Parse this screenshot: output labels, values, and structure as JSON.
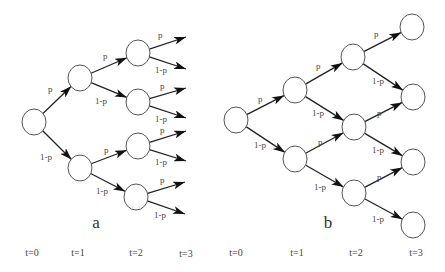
{
  "figure": {
    "width": 445,
    "height": 272,
    "node_radius": 12,
    "colors": {
      "node_stroke": "#555555",
      "edge": "#222222",
      "arrowhead": "#111111",
      "text": "#444444"
    }
  },
  "trees": [
    {
      "id": "a",
      "caption": "a",
      "caption_pos": [
        96,
        228
      ],
      "type": "binary-tree (non-recombining)",
      "nodes": [
        {
          "id": "a0",
          "t": 0,
          "x": 34,
          "y": 122
        },
        {
          "id": "a1u",
          "t": 1,
          "x": 80,
          "y": 78
        },
        {
          "id": "a1d",
          "t": 1,
          "x": 80,
          "y": 168
        },
        {
          "id": "a2uu",
          "t": 2,
          "x": 138,
          "y": 53
        },
        {
          "id": "a2ud",
          "t": 2,
          "x": 138,
          "y": 102
        },
        {
          "id": "a2du",
          "t": 2,
          "x": 138,
          "y": 146
        },
        {
          "id": "a2dd",
          "t": 2,
          "x": 136,
          "y": 197
        }
      ],
      "edges": [
        {
          "from": "a0",
          "to": "a1u",
          "label": "p",
          "label_pos": [
            48,
            92
          ]
        },
        {
          "from": "a0",
          "to": "a1d",
          "label": "1-p",
          "label_pos": [
            40,
            160
          ]
        },
        {
          "from": "a1u",
          "to": "a2uu",
          "label": "p",
          "label_pos": [
            103,
            59
          ]
        },
        {
          "from": "a1u",
          "to": "a2ud",
          "label": "1-p",
          "label_pos": [
            95,
            104
          ]
        },
        {
          "from": "a1d",
          "to": "a2du",
          "label": "p",
          "label_pos": [
            104,
            153
          ]
        },
        {
          "from": "a1d",
          "to": "a2dd",
          "label": "1-p",
          "label_pos": [
            96,
            194
          ]
        }
      ],
      "open_edges": [
        {
          "from": "a2uu",
          "to": [
            186,
            37
          ],
          "label": "p",
          "label_pos": [
            158,
            38
          ]
        },
        {
          "from": "a2uu",
          "to": [
            186,
            69
          ],
          "label": "1-p",
          "label_pos": [
            155,
            73
          ]
        },
        {
          "from": "a2ud",
          "to": [
            186,
            88
          ],
          "label": "p",
          "label_pos": [
            160,
            89
          ]
        },
        {
          "from": "a2ud",
          "to": [
            186,
            118
          ],
          "label": "1-p",
          "label_pos": [
            155,
            122
          ]
        },
        {
          "from": "a2du",
          "to": [
            186,
            131
          ],
          "label": "p",
          "label_pos": [
            160,
            133
          ]
        },
        {
          "from": "a2du",
          "to": [
            186,
            161
          ],
          "label": "1-p",
          "label_pos": [
            155,
            165
          ]
        },
        {
          "from": "a2dd",
          "to": [
            185,
            182
          ],
          "label": "p",
          "label_pos": [
            160,
            183
          ]
        },
        {
          "from": "a2dd",
          "to": [
            185,
            214
          ],
          "label": "1-p",
          "label_pos": [
            154,
            218
          ]
        }
      ],
      "time_labels": [
        {
          "label": "t=0",
          "x": 32,
          "y": 256
        },
        {
          "label": "t=1",
          "x": 78,
          "y": 256
        },
        {
          "label": "t=2",
          "x": 136,
          "y": 256
        },
        {
          "label": "t=3",
          "x": 186,
          "y": 257
        }
      ]
    },
    {
      "id": "b",
      "caption": "b",
      "caption_pos": [
        328,
        228
      ],
      "type": "recombining lattice",
      "nodes": [
        {
          "id": "b0",
          "t": 0,
          "x": 236,
          "y": 120
        },
        {
          "id": "b1u",
          "t": 1,
          "x": 295,
          "y": 90
        },
        {
          "id": "b1d",
          "t": 1,
          "x": 295,
          "y": 159
        },
        {
          "id": "b2u",
          "t": 2,
          "x": 353,
          "y": 57
        },
        {
          "id": "b2m",
          "t": 2,
          "x": 354,
          "y": 127
        },
        {
          "id": "b2d",
          "t": 2,
          "x": 354,
          "y": 193
        },
        {
          "id": "b3a",
          "t": 3,
          "x": 412,
          "y": 27
        },
        {
          "id": "b3b",
          "t": 3,
          "x": 413,
          "y": 97
        },
        {
          "id": "b3c",
          "t": 3,
          "x": 413,
          "y": 162
        },
        {
          "id": "b3d",
          "t": 3,
          "x": 413,
          "y": 225
        }
      ],
      "edges": [
        {
          "from": "b0",
          "to": "b1u",
          "label": "p",
          "label_pos": [
            258,
            102
          ]
        },
        {
          "from": "b0",
          "to": "b1d",
          "label": "1-p",
          "label_pos": [
            254,
            148
          ]
        },
        {
          "from": "b1u",
          "to": "b2u",
          "label": "p",
          "label_pos": [
            316,
            69
          ]
        },
        {
          "from": "b1u",
          "to": "b2m",
          "label": "1-p",
          "label_pos": [
            312,
            116
          ]
        },
        {
          "from": "b1d",
          "to": "b2m",
          "label": "p",
          "label_pos": [
            318,
            145
          ]
        },
        {
          "from": "b1d",
          "to": "b2d",
          "label": "1-p",
          "label_pos": [
            314,
            190
          ]
        },
        {
          "from": "b2u",
          "to": "b3a",
          "label": "p",
          "label_pos": [
            374,
            37
          ]
        },
        {
          "from": "b2u",
          "to": "b3b",
          "label": "1-p",
          "label_pos": [
            372,
            84
          ]
        },
        {
          "from": "b2m",
          "to": "b3b",
          "label": "p",
          "label_pos": [
            377,
            116
          ]
        },
        {
          "from": "b2m",
          "to": "b3c",
          "label": "1-p",
          "label_pos": [
            372,
            153
          ]
        },
        {
          "from": "b2d",
          "to": "b3c",
          "label": "p",
          "label_pos": [
            377,
            180
          ]
        },
        {
          "from": "b2d",
          "to": "b3d",
          "label": "1-p",
          "label_pos": [
            372,
            222
          ]
        }
      ],
      "open_edges": [],
      "time_labels": [
        {
          "label": "t=0",
          "x": 236,
          "y": 256
        },
        {
          "label": "t=1",
          "x": 297,
          "y": 256
        },
        {
          "label": "t=2",
          "x": 356,
          "y": 256
        },
        {
          "label": "t=3",
          "x": 416,
          "y": 256
        }
      ]
    }
  ]
}
